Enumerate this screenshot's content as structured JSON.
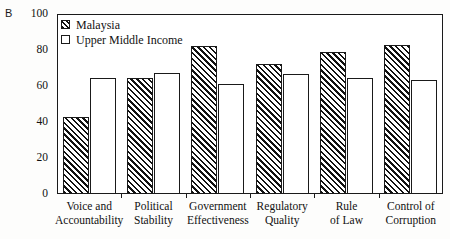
{
  "panel": {
    "letter": "B"
  },
  "chart_data": {
    "type": "bar",
    "title": "",
    "xlabel": "",
    "ylabel": "",
    "ylim": [
      0,
      100
    ],
    "yticks": [
      0,
      20,
      40,
      60,
      80,
      100
    ],
    "ytick_labels": [
      "0",
      "20",
      "40",
      "60",
      "80",
      "100"
    ],
    "grid": false,
    "legend_position": "top-left",
    "categories": [
      "Voice and Accountability",
      "Political Stability",
      "Government Effectiveness",
      "Regulatory Quality",
      "Rule of Law",
      "Control of Corruption"
    ],
    "category_lines": [
      [
        "Voice and",
        "Accountability"
      ],
      [
        "Political",
        "Stability"
      ],
      [
        "Government",
        "Effectiveness"
      ],
      [
        "Regulatory",
        "Quality"
      ],
      [
        "Rule",
        "of Law"
      ],
      [
        "Control of",
        "Corruption"
      ]
    ],
    "series": [
      {
        "name": "Malaysia",
        "fill": "diagonal-hatch",
        "values": [
          43,
          64.5,
          82,
          72,
          79,
          83
        ]
      },
      {
        "name": "Upper Middle Income",
        "fill": "open",
        "values": [
          64.5,
          67.5,
          61,
          66.5,
          64.5,
          63.5
        ]
      }
    ]
  },
  "colors": {
    "ink": "#1a1a1a",
    "background": "#ffffff"
  }
}
